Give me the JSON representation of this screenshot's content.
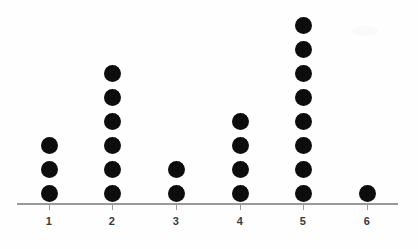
{
  "chart_data": {
    "type": "bar",
    "render_style": "dot-plot",
    "title": "",
    "xlabel": "",
    "ylabel": "",
    "categories": [
      "1",
      "2",
      "3",
      "4",
      "5",
      "6"
    ],
    "values": [
      3,
      6,
      2,
      4,
      8,
      1
    ],
    "total_count": 24,
    "ylim": [
      0,
      8
    ],
    "grid": false,
    "legend": null,
    "axis_visible": {
      "x": true,
      "y": false
    },
    "tick_labels": [
      "1",
      "2",
      "3",
      "4",
      "5",
      "6"
    ],
    "colors": {
      "dot": "#0d0d0d",
      "axis": "#9a9a9a",
      "label": "#3a3a3a",
      "background": "#fefefe"
    }
  },
  "geometry": {
    "dot_diameter": 17,
    "dot_pitch": 24,
    "baseline_dot_center_y": 193,
    "axis_y": 203,
    "axis_x_start": 17,
    "axis_x_end": 398,
    "column_centers": [
      49,
      112,
      176,
      240,
      303,
      367
    ],
    "tick_label_y": 215
  }
}
